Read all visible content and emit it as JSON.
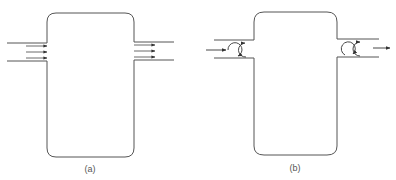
{
  "figure": {
    "panels": [
      {
        "id": "a",
        "label": "(a)",
        "description": "Tank with inlet and outlet pipes showing uniform (plug) flow: parallel arrows entering and leaving",
        "inlet_arrows": 3,
        "outlet_arrows": 3
      },
      {
        "id": "b",
        "label": "(b)",
        "description": "Tank with inlet and outlet pipes showing mixing eddies (circulating arrows) at entrance and exit",
        "inlet_eddies": 2,
        "outlet_eddies": 2
      }
    ],
    "colors": {
      "line": "#555555",
      "arrow": "#333333",
      "background": "#ffffff"
    }
  }
}
